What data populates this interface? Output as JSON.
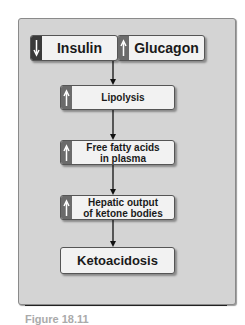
{
  "diagram": {
    "nodes": [
      {
        "id": "insulin",
        "label": "Insulin",
        "direction": "down",
        "indicator_color": "#3a3a3a"
      },
      {
        "id": "glucagon",
        "label": "Glucagon",
        "direction": "up",
        "indicator_color": "#6b6b6b"
      },
      {
        "id": "lipolysis",
        "label": "Lipolysis",
        "direction": "up",
        "indicator_color": "#6b6b6b"
      },
      {
        "id": "ffa",
        "label_line1": "Free fatty acids",
        "label_line2": "in plasma",
        "direction": "up",
        "indicator_color": "#6b6b6b"
      },
      {
        "id": "hepatic",
        "label_line1": "Hepatic output",
        "label_line2": "of ketone bodies",
        "direction": "up",
        "indicator_color": "#6b6b6b"
      },
      {
        "id": "ketoacidosis",
        "label": "Ketoacidosis"
      }
    ],
    "edges": [
      {
        "from": "insulin/glucagon",
        "to": "lipolysis"
      },
      {
        "from": "lipolysis",
        "to": "ffa"
      },
      {
        "from": "ffa",
        "to": "hepatic"
      },
      {
        "from": "hepatic",
        "to": "ketoacidosis"
      }
    ],
    "icons": {
      "down": "down-arrow-icon",
      "up": "up-arrow-icon"
    },
    "colors": {
      "panel": "#d4d4d4",
      "box": "#f2f2f2",
      "text": "#1a1a1a"
    }
  },
  "caption": {
    "text": "Figure 18.11"
  }
}
